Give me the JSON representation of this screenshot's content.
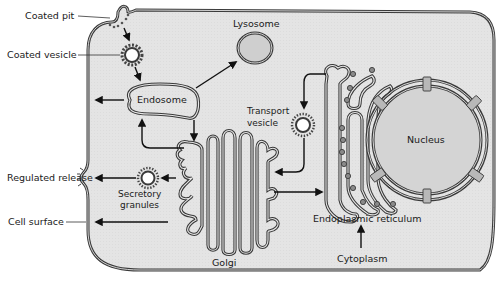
{
  "diagram": {
    "colors": {
      "cytoplasm_fill": "#e6e6e6",
      "organelle_fill_dark": "#d2d2d2",
      "membrane": "#3a3a3a",
      "background": "#ffffff",
      "text": "#1a1a1a"
    },
    "labels": {
      "coated_pit": "Coated pit",
      "coated_vesicle": "Coated vesicle",
      "lysosome": "Lysosome",
      "endosome": "Endosome",
      "transport_vesicle_line1": "Transport",
      "transport_vesicle_line2": "vesicle",
      "nucleus": "Nucleus",
      "regulated_release": "Regulated release",
      "secretory_granules_line1": "Secretory",
      "secretory_granules_line2": "granules",
      "cell_surface": "Cell surface",
      "golgi": "Golgi",
      "endoplasmic_reticulum": "Endoplasmic reticulum",
      "cytoplasm": "Cytoplasm"
    },
    "pathways": [
      {
        "from": "Coated pit",
        "to": "Coated vesicle"
      },
      {
        "from": "Coated vesicle",
        "to": "Endosome"
      },
      {
        "from": "Endosome",
        "to": "Lysosome"
      },
      {
        "from": "Endosome",
        "to": "Cell surface"
      },
      {
        "from": "Endosome",
        "to": "Golgi"
      },
      {
        "from": "Golgi",
        "to": "Endosome"
      },
      {
        "from": "Endoplasmic reticulum",
        "to": "Transport vesicle"
      },
      {
        "from": "Transport vesicle",
        "to": "Golgi"
      },
      {
        "from": "Golgi",
        "to": "Endoplasmic reticulum"
      },
      {
        "from": "Golgi",
        "to": "Secretory granules"
      },
      {
        "from": "Secretory granules",
        "to": "Regulated release"
      },
      {
        "from": "Golgi",
        "to": "Cell surface"
      },
      {
        "from": "Cytoplasm",
        "to": "Endoplasmic reticulum"
      }
    ]
  }
}
